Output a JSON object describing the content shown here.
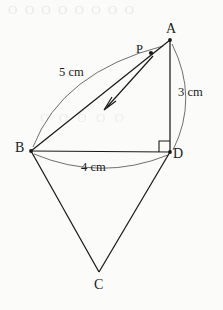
{
  "figure": {
    "type": "geometry-diagram",
    "background_color": "#fbfbfa",
    "stroke_color": "#1a1a1a",
    "vertices": {
      "A": {
        "label": "A",
        "x": 170,
        "y": 40
      },
      "B": {
        "label": "B",
        "x": 31,
        "y": 151
      },
      "C": {
        "label": "C",
        "x": 99,
        "y": 272
      },
      "D": {
        "label": "D",
        "x": 170,
        "y": 152
      },
      "P": {
        "label": "P",
        "x": 151,
        "y": 53
      }
    },
    "measures": {
      "ab": "5 cm",
      "ad": "3 cm",
      "bd": "4 cm"
    },
    "right_angle_at": "D",
    "arrow": {
      "name": "direction-arrow",
      "from": {
        "x": 153,
        "y": 56
      },
      "to": {
        "x": 104,
        "y": 110
      },
      "direction": "A-to-B"
    },
    "segments": [
      {
        "name": "segment-AB",
        "from": "A",
        "to": "B"
      },
      {
        "name": "segment-AD",
        "from": "A",
        "to": "D"
      },
      {
        "name": "segment-BD",
        "from": "B",
        "to": "D"
      },
      {
        "name": "segment-BC",
        "from": "B",
        "to": "C"
      },
      {
        "name": "segment-DC",
        "from": "D",
        "to": "C"
      }
    ],
    "arcs": [
      {
        "name": "arc-AB",
        "label": "5 cm"
      },
      {
        "name": "arc-AD",
        "label": "3 cm"
      },
      {
        "name": "arc-BD",
        "label": "4 cm"
      }
    ],
    "bleed": {
      "top": "O O O   O O O O O",
      "mid": "O O O O O"
    }
  }
}
